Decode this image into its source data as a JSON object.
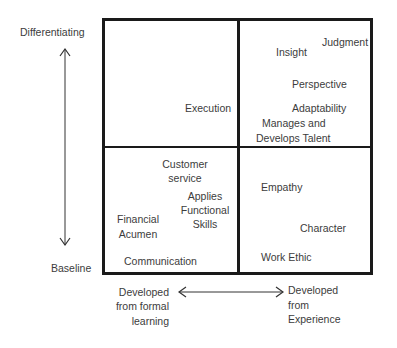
{
  "axes": {
    "y_top": "Differentiating",
    "y_bottom": "Baseline",
    "x_left": [
      "Developed",
      "from formal",
      "learning"
    ],
    "x_right": [
      "Developed",
      "from",
      "Experience"
    ]
  },
  "quadrants": {
    "top_left": {
      "items": [
        "Execution"
      ]
    },
    "top_right": {
      "items": [
        "Judgment",
        "Insight",
        "Perspective",
        "Adaptability",
        "Manages and",
        "Develops Talent"
      ]
    },
    "bottom_left": {
      "items": [
        "Customer",
        "service",
        "Applies",
        "Functional",
        "Skills",
        "Financial",
        "Acumen",
        "Communication"
      ]
    },
    "bottom_right": {
      "items": [
        "Empathy",
        "Character",
        "Work Ethic"
      ]
    }
  },
  "colors": {
    "line": "#1a1a1a",
    "text": "#3c3c3c",
    "background": "#ffffff"
  }
}
